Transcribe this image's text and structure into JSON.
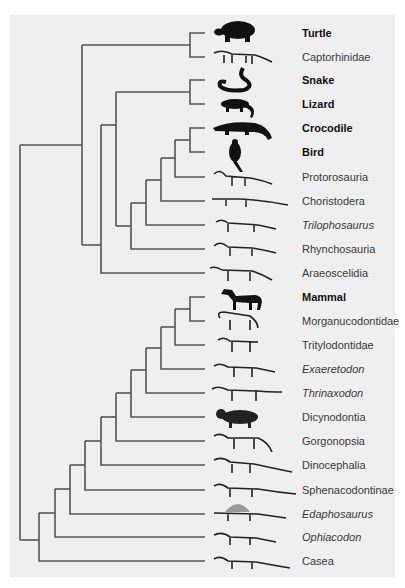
{
  "figure": {
    "type": "phylogenetic-tree",
    "line_color": "#555555",
    "panel_color": "#efefef",
    "leaves": [
      {
        "label": "Turtle",
        "style": "bold",
        "y": 33,
        "silhouette": "turtle-silhouette"
      },
      {
        "label": "Captorhinidae",
        "style": "normal",
        "y": 57,
        "silhouette": "captorhinid-skeleton"
      },
      {
        "label": "Snake",
        "style": "bold",
        "y": 80,
        "silhouette": "snake-silhouette"
      },
      {
        "label": "Lizard",
        "style": "bold",
        "y": 104,
        "silhouette": "lizard-silhouette"
      },
      {
        "label": "Crocodile",
        "style": "bold",
        "y": 128,
        "silhouette": "crocodile-silhouette"
      },
      {
        "label": "Bird",
        "style": "bold",
        "y": 152,
        "silhouette": "bird-silhouette"
      },
      {
        "label": "Protorosauria",
        "style": "normal",
        "y": 177,
        "silhouette": "protorosaur-skeleton"
      },
      {
        "label": "Choristodera",
        "style": "normal",
        "y": 201,
        "silhouette": "choristodere-skeleton"
      },
      {
        "label": "Trilophosaurus",
        "style": "italic",
        "y": 225,
        "silhouette": "trilophosaurus-skeleton"
      },
      {
        "label": "Rhynchosauria",
        "style": "normal",
        "y": 249,
        "silhouette": "rhynchosaur-skeleton"
      },
      {
        "label": "Araeoscelidia",
        "style": "normal",
        "y": 273,
        "silhouette": "araeoscelid-skeleton"
      },
      {
        "label": "Mammal",
        "style": "bold",
        "y": 297,
        "silhouette": "horse-silhouette"
      },
      {
        "label": "Morganucodontidae",
        "style": "normal",
        "y": 321,
        "silhouette": "morganucodontid-skeleton"
      },
      {
        "label": "Tritylodontidae",
        "style": "normal",
        "y": 345,
        "silhouette": "tritylodontid-skeleton"
      },
      {
        "label": "Exaeretodon",
        "style": "italic",
        "y": 369,
        "silhouette": "exaeretodon-skeleton"
      },
      {
        "label": "Thrinaxodon",
        "style": "italic",
        "y": 393,
        "silhouette": "thrinaxodon-skeleton"
      },
      {
        "label": "Dicynodontia",
        "style": "normal",
        "y": 417,
        "silhouette": "dicynodont-skeleton"
      },
      {
        "label": "Gorgonopsia",
        "style": "normal",
        "y": 441,
        "silhouette": "gorgonopsian-skeleton"
      },
      {
        "label": "Dinocephalia",
        "style": "normal",
        "y": 465,
        "silhouette": "dinocephalian-skeleton"
      },
      {
        "label": "Sphenacodontinae",
        "style": "normal",
        "y": 490,
        "silhouette": "sphenacodont-skeleton"
      },
      {
        "label": "Edaphosaurus",
        "style": "italic",
        "y": 514,
        "silhouette": "edaphosaurus-skeleton"
      },
      {
        "label": "Ophiacodon",
        "style": "italic",
        "y": 537,
        "silhouette": "ophiacodon-skeleton"
      },
      {
        "label": "Casea",
        "style": "normal",
        "y": 561,
        "silhouette": "casea-skeleton"
      }
    ]
  }
}
